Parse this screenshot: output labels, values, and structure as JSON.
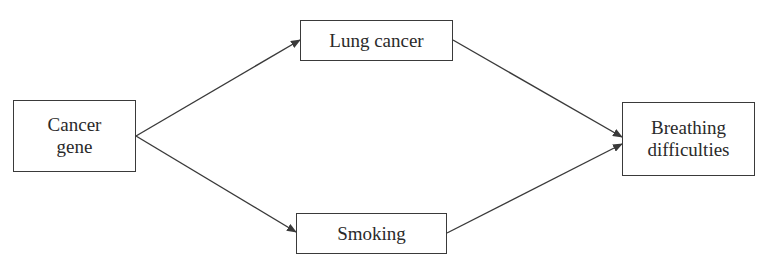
{
  "diagram": {
    "type": "causal-graph",
    "nodes": [
      {
        "id": "cancer_gene",
        "label": "Cancer\ngene"
      },
      {
        "id": "lung_cancer",
        "label": "Lung cancer"
      },
      {
        "id": "smoking",
        "label": "Smoking"
      },
      {
        "id": "breathing",
        "label": "Breathing\ndifficulties"
      }
    ],
    "edges": [
      {
        "from": "cancer_gene",
        "to": "lung_cancer"
      },
      {
        "from": "cancer_gene",
        "to": "smoking"
      },
      {
        "from": "lung_cancer",
        "to": "breathing"
      },
      {
        "from": "smoking",
        "to": "breathing"
      }
    ],
    "colors": {
      "line": "#3a3a3a",
      "text": "#2a2a2a",
      "background": "#ffffff"
    }
  }
}
